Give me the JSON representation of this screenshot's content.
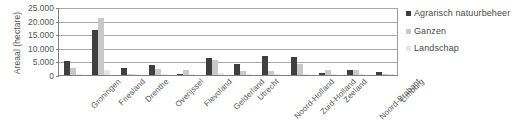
{
  "chart_data": {
    "type": "bar",
    "title": "",
    "xlabel": "",
    "ylabel": "Areaal (hectare)",
    "ylim": [
      0,
      25000
    ],
    "ytick_labels": [
      "25.000",
      "20.000",
      "15.000",
      "10.000",
      "5.000",
      "0"
    ],
    "yticks": [
      25000,
      20000,
      15000,
      10000,
      5000,
      0
    ],
    "grid": true,
    "legend_position": "right",
    "categories": [
      "Groningen",
      "Friesland",
      "Drenthe",
      "Overijssel",
      "Flevoland",
      "Gelderland",
      "Utrecht",
      "Noord-Holland",
      "Zuid-Holland",
      "Zeeland",
      "Noord-Brabant",
      "Limburg"
    ],
    "series": [
      {
        "name": "Agrarisch natuurbeheer",
        "color": "#3f3f3f",
        "values": [
          5000,
          16500,
          2400,
          3800,
          300,
          6300,
          4000,
          7000,
          6700,
          600,
          1800,
          1200
        ]
      },
      {
        "name": "Ganzen",
        "color": "#c9c9c9",
        "values": [
          2600,
          21000,
          300,
          2100,
          1700,
          5700,
          1300,
          1500,
          3900,
          1900,
          1900,
          300
        ]
      },
      {
        "name": "Landschap",
        "color": "#e6e6e6",
        "values": [
          500,
          1900,
          200,
          300,
          200,
          700,
          300,
          300,
          400,
          200,
          300,
          200
        ]
      }
    ]
  },
  "legend": {
    "entries": [
      {
        "label": "Agrarisch natuurbeheer"
      },
      {
        "label": "Ganzen"
      },
      {
        "label": "Landschap"
      }
    ]
  }
}
